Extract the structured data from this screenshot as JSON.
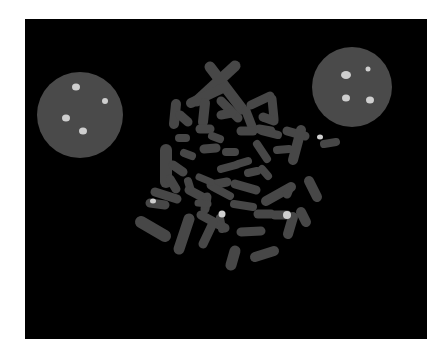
{
  "image": {
    "description": "FISH metaphase spread with two interphase nuclei",
    "background": "#000000",
    "frame": {
      "x": 25,
      "y": 19,
      "width": 402,
      "height": 320
    },
    "colors": {
      "chromosome": "#474747",
      "nucleus": "#4a4a4a",
      "signal": "#cfcfcf"
    }
  },
  "nuclei": [
    {
      "cx": 55,
      "cy": 96,
      "r": 43,
      "spots": [
        [
          51,
          68,
          4,
          3.5
        ],
        [
          80,
          82,
          3,
          3
        ],
        [
          41,
          99,
          4,
          3.5
        ],
        [
          58,
          112,
          4,
          3.5
        ]
      ]
    },
    {
      "cx": 327,
      "cy": 68,
      "r": 40,
      "spots": [
        [
          321,
          56,
          5,
          4
        ],
        [
          343,
          50,
          2.5,
          2.5
        ],
        [
          321,
          79,
          4,
          3.5
        ],
        [
          345,
          81,
          4,
          3.5
        ]
      ]
    }
  ],
  "chromosomes": [
    {
      "d": "M185 48 L217 90",
      "w": 11
    },
    {
      "d": "M210 47 L172 82",
      "w": 11
    },
    {
      "d": "M200 68 L166 84",
      "w": 10
    },
    {
      "d": "M196 82 L213 99",
      "w": 9
    },
    {
      "d": "M226 86 L245 77",
      "w": 9
    },
    {
      "d": "M247 80 L249 100",
      "w": 9
    },
    {
      "d": "M151 85 L149 105",
      "w": 10
    },
    {
      "d": "M155 96 L163 103",
      "w": 9
    },
    {
      "d": "M180 84 L178 103",
      "w": 10
    },
    {
      "d": "M207 94 L196 96",
      "w": 9
    },
    {
      "d": "M221 92 L228 110",
      "w": 9
    },
    {
      "d": "M238 98 L249 102",
      "w": 9
    },
    {
      "d": "M234 110 L246 112",
      "w": 9
    },
    {
      "d": "M216 112 L228 112",
      "w": 9
    },
    {
      "d": "M237 112 L253 116",
      "w": 8
    },
    {
      "d": "M262 112 L280 117",
      "w": 9
    },
    {
      "d": "M175 110 L185 110",
      "w": 9
    },
    {
      "d": "M187 117 L195 120",
      "w": 8
    },
    {
      "d": "M154 119 L161 119",
      "w": 8
    },
    {
      "d": "M141 131 L141 163",
      "w": 12
    },
    {
      "d": "M159 134 L167 137",
      "w": 8
    },
    {
      "d": "M179 130 L191 129",
      "w": 9
    },
    {
      "d": "M201 133 L210 133",
      "w": 8
    },
    {
      "d": "M232 125 L242 140",
      "w": 8
    },
    {
      "d": "M252 131 L264 130",
      "w": 8
    },
    {
      "d": "M276 111 L268 141",
      "w": 10
    },
    {
      "d": "M299 125 L311 123",
      "w": 8
    },
    {
      "d": "M148 146 L158 153",
      "w": 9
    },
    {
      "d": "M163 162 L166 172",
      "w": 8
    },
    {
      "d": "M145 160 L151 170",
      "w": 9
    },
    {
      "d": "M213 145 L223 142",
      "w": 8
    },
    {
      "d": "M223 154 L232 152",
      "w": 8
    },
    {
      "d": "M237 150 L243 157",
      "w": 8
    },
    {
      "d": "M196 150 L211 146",
      "w": 8
    },
    {
      "d": "M186 166 L202 163",
      "w": 9
    },
    {
      "d": "M210 165 L231 171",
      "w": 9
    },
    {
      "d": "M164 171 L181 180",
      "w": 9
    },
    {
      "d": "M188 168 L205 177",
      "w": 8
    },
    {
      "d": "M174 158 L186 163",
      "w": 7
    },
    {
      "d": "M241 182 L266 168",
      "w": 10
    },
    {
      "d": "M284 162 L292 178",
      "w": 10
    },
    {
      "d": "M262 175 L264 170",
      "w": 9
    },
    {
      "d": "M182 178 L180 190",
      "w": 9
    },
    {
      "d": "M130 173 L152 180",
      "w": 9
    },
    {
      "d": "M125 184 L140 186",
      "w": 9
    },
    {
      "d": "M195 199 L197 210",
      "w": 8
    },
    {
      "d": "M173 184 L183 185",
      "w": 7
    },
    {
      "d": "M209 185 L228 188",
      "w": 8
    },
    {
      "d": "M233 195 L246 195",
      "w": 9
    },
    {
      "d": "M250 196 L262 196",
      "w": 9
    },
    {
      "d": "M268 198 L263 215",
      "w": 10
    },
    {
      "d": "M276 193 L281 203",
      "w": 10
    },
    {
      "d": "M176 196 L200 209",
      "w": 9
    },
    {
      "d": "M188 204 L178 225",
      "w": 9
    },
    {
      "d": "M164 200 L154 230",
      "w": 11
    },
    {
      "d": "M116 203 L140 217",
      "w": 12
    },
    {
      "d": "M210 232 L206 246",
      "w": 11
    },
    {
      "d": "M230 238 L249 232",
      "w": 10
    },
    {
      "d": "M216 213 L236 212",
      "w": 9
    }
  ],
  "chromosome_signals": [
    [
      128,
      182,
      3,
      2.5
    ],
    [
      197,
      195,
      3.5,
      3.5
    ],
    [
      262,
      196,
      4,
      4
    ],
    [
      295,
      118,
      3,
      2.5
    ]
  ]
}
